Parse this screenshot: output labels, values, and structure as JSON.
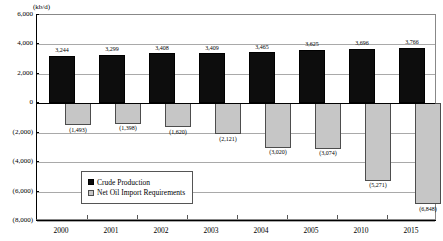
{
  "chart_data": {
    "type": "bar",
    "title": "",
    "subtitle": "",
    "unit_label": "(kb/d)",
    "xlabel": "",
    "ylabel": "",
    "ylim": [
      -8000,
      6000
    ],
    "ytick_step": 2000,
    "grid": true,
    "legend_position": "inside-bottom-left",
    "categories": [
      "2000",
      "2001",
      "2002",
      "2003",
      "2004",
      "2005",
      "2010",
      "2015"
    ],
    "series": [
      {
        "name": "Crude Production",
        "color": "#0d0d0d",
        "values": [
          3244,
          3299,
          3408,
          3409,
          3465,
          3625,
          3696,
          3766
        ],
        "labels": [
          "3,244",
          "3,299",
          "3,408",
          "3,409",
          "3,465",
          "3,625",
          "3,696",
          "3,766"
        ]
      },
      {
        "name": "Net Oil Import Requirements",
        "color": "#c6c6c6",
        "values": [
          -1493,
          -1398,
          -1620,
          -2121,
          -3020,
          -3074,
          -5271,
          -6848
        ],
        "labels": [
          "(1,493)",
          "(1,398)",
          "(1,620)",
          "(2,121)",
          "(3,020)",
          "(3,074)",
          "(5,271)",
          "(6,848)"
        ]
      }
    ],
    "ytick_labels": [
      "6,000",
      "4,000",
      "2,000",
      "0",
      "(2,000)",
      "(4,000)",
      "(6,000)",
      "(8,000)"
    ],
    "ytick_values": [
      6000,
      4000,
      2000,
      0,
      -2000,
      -4000,
      -6000,
      -8000
    ]
  },
  "legend": {
    "items": [
      {
        "label": "Crude Production",
        "swatch": "pos"
      },
      {
        "label": "Net Oil Import Requirements",
        "swatch": "neg"
      }
    ]
  }
}
